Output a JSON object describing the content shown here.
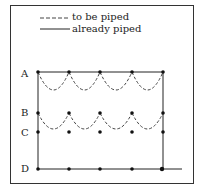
{
  "legend": {
    "dashed_label": "to be piped",
    "solid_label": "already piped"
  },
  "rows": [
    {
      "label": "A",
      "y": 72
    },
    {
      "label": "B",
      "y": 113
    },
    {
      "label": "C",
      "y": 132
    },
    {
      "label": "D",
      "y": 169
    }
  ],
  "columns_x": [
    38,
    69,
    100,
    132,
    163
  ],
  "colors": {
    "line": "#222222",
    "dashed": "#444444"
  }
}
